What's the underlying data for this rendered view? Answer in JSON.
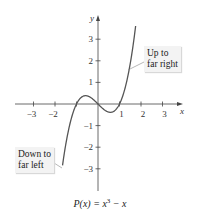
{
  "chart_data": {
    "type": "line",
    "title": "",
    "caption": {
      "lhs": "P(x) = x",
      "exp": "3",
      "rhs": " − x"
    },
    "function": "x^3 - x",
    "xlabel": "x",
    "ylabel": "y",
    "xlim": [
      -3.9,
      3.9
    ],
    "ylim": [
      -4.0,
      4.1
    ],
    "x_ticks": [
      -3,
      -2,
      -1,
      1,
      2,
      3
    ],
    "x_tick_labels": [
      "−3",
      "−2",
      "",
      "1",
      "2",
      "3"
    ],
    "y_ticks": [
      -3,
      -2,
      -1,
      1,
      2,
      3
    ],
    "y_tick_labels": [
      "−3",
      "−2",
      "−1",
      "1",
      "2",
      "3"
    ],
    "grid": false,
    "series": [
      {
        "name": "P(x)",
        "x_range": [
          -1.65,
          1.75
        ],
        "color": "#555555"
      }
    ],
    "annotations": [
      {
        "text_lines": [
          "Up to",
          "far right"
        ],
        "points_to": "right end of curve"
      },
      {
        "text_lines": [
          "Down to",
          "far left"
        ],
        "points_to": "left end of curve"
      }
    ]
  }
}
